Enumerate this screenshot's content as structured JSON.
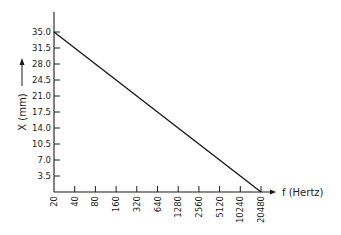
{
  "chart_data": {
    "type": "line",
    "title": "",
    "xlabel": "f (Hertz)",
    "ylabel": "X (mm)",
    "x_scale": "log2",
    "x_ticks": [
      "20",
      "40",
      "80",
      "160",
      "320",
      "640",
      "1280",
      "2560",
      "5120",
      "10240",
      "20480"
    ],
    "y_ticks": [
      "3.5",
      "7.0",
      "10.5",
      "14.0",
      "17.5",
      "21.0",
      "24.5",
      "28.0",
      "31.5",
      "35.0"
    ],
    "ylim": [
      0,
      35
    ],
    "xlim": [
      20,
      20480
    ],
    "grid": false,
    "legend": null,
    "series": [
      {
        "name": "X vs f",
        "x": [
          20,
          40,
          80,
          160,
          320,
          640,
          1280,
          2560,
          5120,
          10240,
          20480
        ],
        "y": [
          35.0,
          31.5,
          28.0,
          24.5,
          21.0,
          17.5,
          14.0,
          10.5,
          7.0,
          3.5,
          0.0
        ]
      }
    ]
  },
  "colors": {
    "line": "#1a1a1a",
    "axis": "#1a1a1a",
    "background": "#ffffff"
  }
}
